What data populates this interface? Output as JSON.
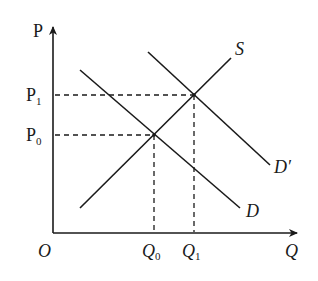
{
  "diagram": {
    "type": "supply-demand",
    "axes": {
      "y_label": "P",
      "x_label": "Q",
      "origin_label": "O"
    },
    "price_levels": [
      {
        "label": "P",
        "sub": "1",
        "y": 95
      },
      {
        "label": "P",
        "sub": "0",
        "y": 135
      }
    ],
    "quantity_levels": [
      {
        "label": "Q",
        "sub": "0",
        "x": 154
      },
      {
        "label": "Q",
        "sub": "1",
        "x": 194
      }
    ],
    "curves": [
      {
        "name": "S",
        "label": "S",
        "from": [
          80,
          208
        ],
        "to": [
          231,
          58
        ]
      },
      {
        "name": "D",
        "label": "D",
        "from": [
          80,
          70
        ],
        "to": [
          240,
          208
        ]
      },
      {
        "name": "D'",
        "label": "D′",
        "from": [
          148,
          52
        ],
        "to": [
          270,
          165
        ]
      }
    ],
    "equilibria": [
      {
        "name": "E0",
        "x": 154,
        "y": 135
      },
      {
        "name": "E1",
        "x": 194,
        "y": 95
      }
    ],
    "colors": {
      "line": "#1a1a1a",
      "background": "#ffffff"
    }
  }
}
